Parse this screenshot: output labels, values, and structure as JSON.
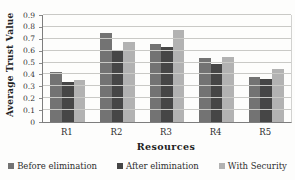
{
  "figure": {
    "background": "#fdfdfc"
  },
  "chart_data": {
    "type": "bar",
    "title": "",
    "xlabel": "Resources",
    "ylabel": "Average Trust Value",
    "categories": [
      "R1",
      "R2",
      "R3",
      "R4",
      "R5"
    ],
    "series": [
      {
        "name": "Before elimination",
        "color": "#737373",
        "values": [
          0.42,
          0.75,
          0.66,
          0.54,
          0.38
        ]
      },
      {
        "name": "After elimination",
        "color": "#464646",
        "values": [
          0.34,
          0.6,
          0.63,
          0.49,
          0.36
        ]
      },
      {
        "name": "With Security",
        "color": "#b2b2b2",
        "values": [
          0.35,
          0.67,
          0.77,
          0.55,
          0.45
        ]
      }
    ],
    "ylim": [
      0,
      0.9
    ],
    "ytick_step": 0.1,
    "yticks": [
      "0",
      "0.1",
      "0.2",
      "0.3",
      "0.4",
      "0.5",
      "0.6",
      "0.7",
      "0.8",
      "0.9"
    ],
    "grid": true,
    "legend_position": "bottom"
  },
  "colors": {
    "gridline": "#c9c9c6",
    "axis": "#7d7d7d",
    "text": "#2b2b2b"
  }
}
